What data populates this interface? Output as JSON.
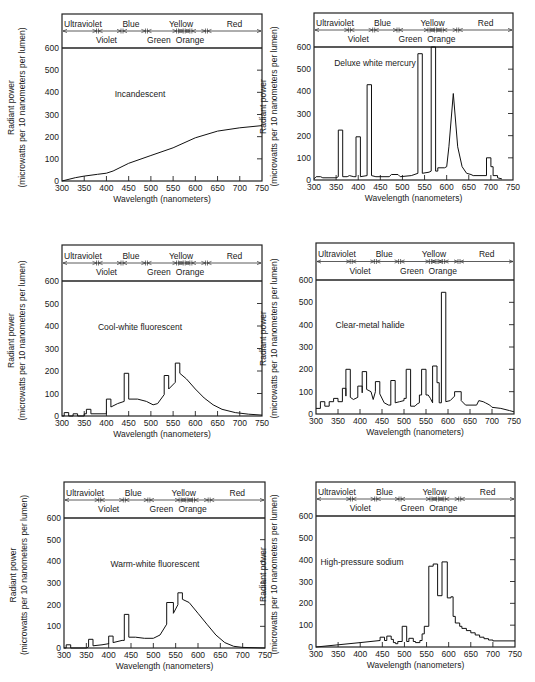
{
  "chart_data": [
    {
      "type": "line",
      "title": "Incandescent",
      "xlabel": "Wavelength (nanometers)",
      "ylabel": "Radiant power",
      "ylabel2": "(microwatts per 10 nanometers per lumen)",
      "xlim": [
        300,
        750
      ],
      "ylim": [
        0,
        600
      ],
      "xticks": [
        300,
        350,
        400,
        450,
        500,
        550,
        600,
        650,
        700,
        750
      ],
      "yticks": [
        0,
        100,
        200,
        300,
        400,
        500,
        600
      ],
      "grid": false,
      "points": [
        [
          300,
          0
        ],
        [
          330,
          15
        ],
        [
          350,
          22
        ],
        [
          380,
          30
        ],
        [
          400,
          35
        ],
        [
          415,
          45
        ],
        [
          450,
          80
        ],
        [
          500,
          115
        ],
        [
          550,
          150
        ],
        [
          600,
          195
        ],
        [
          650,
          225
        ],
        [
          700,
          240
        ],
        [
          750,
          250
        ]
      ]
    },
    {
      "type": "line",
      "title": "Deluxe white mercury",
      "xlabel": "Wavelength (nanometers)",
      "ylabel": "Radiant power",
      "ylabel2": "(microwatts per 10 nanometers per lumen)",
      "xlim": [
        300,
        750
      ],
      "ylim": [
        0,
        600
      ],
      "xticks": [
        300,
        350,
        400,
        450,
        500,
        550,
        600,
        650,
        700,
        750
      ],
      "yticks": [
        0,
        100,
        200,
        300,
        400,
        500,
        600
      ],
      "grid": false,
      "points": [
        [
          300,
          5
        ],
        [
          305,
          15
        ],
        [
          315,
          15
        ],
        [
          320,
          10
        ],
        [
          350,
          10
        ],
        [
          355,
          15
        ],
        [
          355,
          225
        ],
        [
          365,
          225
        ],
        [
          365,
          15
        ],
        [
          375,
          15
        ],
        [
          380,
          20
        ],
        [
          390,
          15
        ],
        [
          395,
          15
        ],
        [
          395,
          195
        ],
        [
          405,
          195
        ],
        [
          405,
          15
        ],
        [
          420,
          20
        ],
        [
          420,
          430
        ],
        [
          430,
          430
        ],
        [
          430,
          20
        ],
        [
          440,
          15
        ],
        [
          470,
          15
        ],
        [
          475,
          25
        ],
        [
          490,
          25
        ],
        [
          495,
          15
        ],
        [
          520,
          20
        ],
        [
          535,
          30
        ],
        [
          535,
          570
        ],
        [
          545,
          570
        ],
        [
          545,
          30
        ],
        [
          560,
          35
        ],
        [
          565,
          40
        ],
        [
          565,
          600
        ],
        [
          575,
          600
        ],
        [
          575,
          40
        ],
        [
          580,
          40
        ],
        [
          580,
          55
        ],
        [
          595,
          55
        ],
        [
          600,
          60
        ],
        [
          605,
          150
        ],
        [
          615,
          390
        ],
        [
          625,
          150
        ],
        [
          635,
          60
        ],
        [
          645,
          30
        ],
        [
          655,
          25
        ],
        [
          660,
          20
        ],
        [
          690,
          20
        ],
        [
          690,
          100
        ],
        [
          700,
          100
        ],
        [
          700,
          60
        ],
        [
          705,
          60
        ],
        [
          705,
          20
        ],
        [
          715,
          20
        ],
        [
          715,
          10
        ],
        [
          725,
          5
        ]
      ]
    },
    {
      "type": "line",
      "title": "Cool-white fluorescent",
      "xlabel": "Wavelength (nanometers)",
      "ylabel": "Radiant power",
      "ylabel2": "(microwatts per 10 nanometers per lumen)",
      "xlim": [
        300,
        750
      ],
      "ylim": [
        0,
        600
      ],
      "xticks": [
        300,
        350,
        400,
        450,
        500,
        550,
        600,
        650,
        700,
        750
      ],
      "yticks": [
        0,
        100,
        200,
        300,
        400,
        500,
        600
      ],
      "grid": false,
      "points": [
        [
          300,
          0
        ],
        [
          305,
          0
        ],
        [
          305,
          15
        ],
        [
          315,
          15
        ],
        [
          315,
          0
        ],
        [
          325,
          0
        ],
        [
          325,
          10
        ],
        [
          335,
          10
        ],
        [
          335,
          0
        ],
        [
          350,
          0
        ],
        [
          350,
          10
        ],
        [
          355,
          10
        ],
        [
          355,
          30
        ],
        [
          365,
          30
        ],
        [
          365,
          10
        ],
        [
          400,
          10
        ],
        [
          400,
          75
        ],
        [
          410,
          75
        ],
        [
          410,
          40
        ],
        [
          425,
          55
        ],
        [
          440,
          65
        ],
        [
          440,
          190
        ],
        [
          450,
          190
        ],
        [
          450,
          75
        ],
        [
          470,
          75
        ],
        [
          490,
          65
        ],
        [
          505,
          50
        ],
        [
          515,
          55
        ],
        [
          530,
          95
        ],
        [
          530,
          180
        ],
        [
          540,
          180
        ],
        [
          540,
          120
        ],
        [
          555,
          150
        ],
        [
          555,
          235
        ],
        [
          565,
          235
        ],
        [
          565,
          190
        ],
        [
          580,
          165
        ],
        [
          600,
          120
        ],
        [
          620,
          80
        ],
        [
          640,
          50
        ],
        [
          660,
          30
        ],
        [
          690,
          15
        ],
        [
          720,
          8
        ],
        [
          750,
          4
        ]
      ]
    },
    {
      "type": "line",
      "title": "Clear-metal halide",
      "xlabel": "Wavelength (nanometers)",
      "ylabel": "Radiant power",
      "ylabel2": "(microwatts per 10 nanometers per lumen)",
      "xlim": [
        300,
        750
      ],
      "ylim": [
        0,
        600
      ],
      "xticks": [
        300,
        350,
        400,
        450,
        500,
        550,
        600,
        650,
        700,
        750
      ],
      "yticks": [
        0,
        100,
        200,
        300,
        400,
        500,
        600
      ],
      "grid": false,
      "points": [
        [
          300,
          25
        ],
        [
          310,
          25
        ],
        [
          310,
          55
        ],
        [
          320,
          55
        ],
        [
          320,
          35
        ],
        [
          330,
          35
        ],
        [
          330,
          55
        ],
        [
          340,
          55
        ],
        [
          340,
          70
        ],
        [
          350,
          70
        ],
        [
          350,
          55
        ],
        [
          360,
          55
        ],
        [
          360,
          115
        ],
        [
          368,
          115
        ],
        [
          368,
          80
        ],
        [
          368,
          200
        ],
        [
          378,
          200
        ],
        [
          378,
          75
        ],
        [
          385,
          65
        ],
        [
          395,
          75
        ],
        [
          395,
          125
        ],
        [
          405,
          125
        ],
        [
          405,
          95
        ],
        [
          405,
          190
        ],
        [
          415,
          190
        ],
        [
          415,
          110
        ],
        [
          425,
          100
        ],
        [
          430,
          65
        ],
        [
          435,
          100
        ],
        [
          435,
          145
        ],
        [
          445,
          145
        ],
        [
          445,
          90
        ],
        [
          455,
          50
        ],
        [
          465,
          40
        ],
        [
          470,
          40
        ],
        [
          470,
          150
        ],
        [
          480,
          150
        ],
        [
          480,
          50
        ],
        [
          490,
          55
        ],
        [
          500,
          60
        ],
        [
          500,
          70
        ],
        [
          505,
          70
        ],
        [
          505,
          200
        ],
        [
          515,
          200
        ],
        [
          515,
          35
        ],
        [
          525,
          35
        ],
        [
          530,
          45
        ],
        [
          535,
          50
        ],
        [
          535,
          85
        ],
        [
          540,
          85
        ],
        [
          540,
          200
        ],
        [
          550,
          200
        ],
        [
          550,
          85
        ],
        [
          555,
          85
        ],
        [
          560,
          70
        ],
        [
          565,
          50
        ],
        [
          565,
          215
        ],
        [
          575,
          215
        ],
        [
          575,
          140
        ],
        [
          580,
          140
        ],
        [
          580,
          50
        ],
        [
          585,
          50
        ],
        [
          585,
          545
        ],
        [
          595,
          545
        ],
        [
          595,
          55
        ],
        [
          605,
          60
        ],
        [
          615,
          80
        ],
        [
          615,
          100
        ],
        [
          630,
          100
        ],
        [
          630,
          60
        ],
        [
          640,
          40
        ],
        [
          650,
          40
        ],
        [
          665,
          40
        ],
        [
          670,
          60
        ],
        [
          680,
          55
        ],
        [
          685,
          50
        ],
        [
          695,
          40
        ],
        [
          700,
          30
        ],
        [
          720,
          25
        ],
        [
          740,
          15
        ],
        [
          750,
          10
        ]
      ]
    },
    {
      "type": "line",
      "title": "Warm-white fluorescent",
      "xlabel": "Wavelength (nanometers)",
      "ylabel": "Radiant power",
      "ylabel2": "(microwatts per 10 nanometers per lumen)",
      "xlim": [
        300,
        750
      ],
      "ylim": [
        0,
        600
      ],
      "xticks": [
        300,
        350,
        400,
        450,
        500,
        550,
        600,
        650,
        700,
        750
      ],
      "yticks": [
        0,
        100,
        200,
        300,
        400,
        500,
        600
      ],
      "grid": false,
      "points": [
        [
          300,
          0
        ],
        [
          305,
          0
        ],
        [
          305,
          15
        ],
        [
          315,
          15
        ],
        [
          315,
          0
        ],
        [
          350,
          0
        ],
        [
          355,
          5
        ],
        [
          355,
          40
        ],
        [
          365,
          40
        ],
        [
          365,
          10
        ],
        [
          385,
          15
        ],
        [
          400,
          20
        ],
        [
          400,
          55
        ],
        [
          410,
          55
        ],
        [
          410,
          25
        ],
        [
          430,
          35
        ],
        [
          435,
          35
        ],
        [
          435,
          155
        ],
        [
          445,
          155
        ],
        [
          445,
          50
        ],
        [
          460,
          50
        ],
        [
          480,
          45
        ],
        [
          500,
          45
        ],
        [
          515,
          60
        ],
        [
          530,
          110
        ],
        [
          530,
          210
        ],
        [
          545,
          210
        ],
        [
          545,
          160
        ],
        [
          555,
          200
        ],
        [
          555,
          255
        ],
        [
          565,
          255
        ],
        [
          565,
          225
        ],
        [
          580,
          210
        ],
        [
          600,
          160
        ],
        [
          620,
          110
        ],
        [
          640,
          60
        ],
        [
          660,
          25
        ],
        [
          680,
          8
        ],
        [
          700,
          3
        ],
        [
          750,
          0
        ]
      ]
    },
    {
      "type": "line",
      "title": "High-pressure sodium",
      "xlabel": "Wavelength (nanometers)",
      "ylabel": "Radiant power",
      "ylabel2": "(microwatts per 10 nanometers per lumen)",
      "xlim": [
        300,
        750
      ],
      "ylim": [
        0,
        600
      ],
      "xticks": [
        300,
        350,
        400,
        450,
        500,
        550,
        600,
        650,
        700,
        750
      ],
      "yticks": [
        0,
        100,
        200,
        300,
        400,
        500,
        600
      ],
      "grid": false,
      "points": [
        [
          300,
          0
        ],
        [
          350,
          10
        ],
        [
          400,
          20
        ],
        [
          445,
          30
        ],
        [
          445,
          45
        ],
        [
          455,
          45
        ],
        [
          455,
          30
        ],
        [
          460,
          30
        ],
        [
          460,
          50
        ],
        [
          470,
          50
        ],
        [
          470,
          35
        ],
        [
          475,
          35
        ],
        [
          475,
          20
        ],
        [
          480,
          20
        ],
        [
          480,
          15
        ],
        [
          485,
          15
        ],
        [
          485,
          25
        ],
        [
          495,
          25
        ],
        [
          495,
          95
        ],
        [
          505,
          95
        ],
        [
          505,
          25
        ],
        [
          510,
          25
        ],
        [
          510,
          40
        ],
        [
          520,
          40
        ],
        [
          520,
          25
        ],
        [
          525,
          25
        ],
        [
          525,
          20
        ],
        [
          535,
          20
        ],
        [
          535,
          30
        ],
        [
          540,
          30
        ],
        [
          540,
          60
        ],
        [
          545,
          60
        ],
        [
          545,
          95
        ],
        [
          555,
          95
        ],
        [
          555,
          370
        ],
        [
          565,
          370
        ],
        [
          565,
          380
        ],
        [
          575,
          380
        ],
        [
          575,
          235
        ],
        [
          585,
          235
        ],
        [
          585,
          390
        ],
        [
          597,
          390
        ],
        [
          597,
          225
        ],
        [
          605,
          225
        ],
        [
          605,
          230
        ],
        [
          610,
          230
        ],
        [
          610,
          140
        ],
        [
          615,
          140
        ],
        [
          615,
          110
        ],
        [
          625,
          110
        ],
        [
          625,
          95
        ],
        [
          630,
          95
        ],
        [
          630,
          85
        ],
        [
          640,
          85
        ],
        [
          640,
          75
        ],
        [
          650,
          75
        ],
        [
          650,
          65
        ],
        [
          660,
          65
        ],
        [
          660,
          55
        ],
        [
          670,
          55
        ],
        [
          670,
          45
        ],
        [
          680,
          45
        ],
        [
          680,
          38
        ],
        [
          690,
          38
        ],
        [
          690,
          32
        ],
        [
          700,
          32
        ],
        [
          700,
          28
        ],
        [
          750,
          28
        ]
      ]
    }
  ],
  "color_bands": {
    "top_labels": [
      {
        "label": "Ultraviolet",
        "x": 300,
        "anchor": "start"
      },
      {
        "label": "Blue",
        "x": 455,
        "anchor": "middle"
      },
      {
        "label": "Yellow",
        "x": 568,
        "anchor": "middle"
      },
      {
        "label": "Red",
        "x": 688,
        "anchor": "middle"
      }
    ],
    "bottom_labels": [
      {
        "label": "Violet",
        "x": 400,
        "anchor": "middle"
      },
      {
        "label": "Green",
        "x": 518,
        "anchor": "middle"
      },
      {
        "label": "Orange",
        "x": 588,
        "anchor": "middle"
      }
    ],
    "boundaries": [
      380,
      435,
      490,
      560,
      575,
      590,
      625
    ]
  }
}
